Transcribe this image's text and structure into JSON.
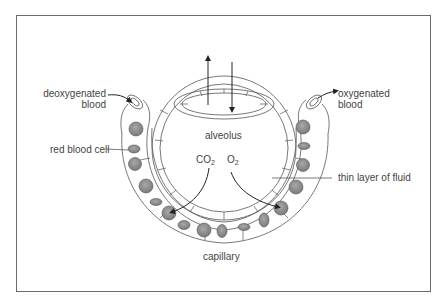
{
  "diagram": {
    "labels": {
      "deoxygenated_line1": "deoxygenated",
      "deoxygenated_line2": "blood",
      "oxygenated_line1": "oxygenated",
      "oxygenated_line2": "blood",
      "alveolus": "alveolus",
      "red_blood_cell": "red blood cell",
      "co2_main": "CO",
      "co2_sub": "2",
      "o2_main": "O",
      "o2_sub": "2",
      "thin_layer": "thin layer of fluid",
      "capillary": "capillary"
    },
    "colors": {
      "line": "#444444",
      "cell_fill": "#8f8f8f",
      "frame": "#6b6b6b"
    }
  }
}
